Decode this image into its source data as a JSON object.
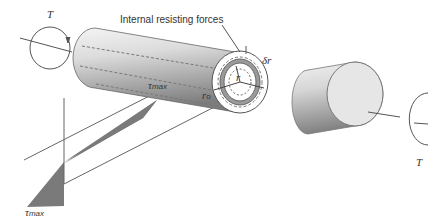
{
  "diagram": {
    "title_label": "Internal resisting forces",
    "torque_left": "T",
    "torque_right": "T",
    "tau_top": {
      "symbol": "τ",
      "subscript": "max"
    },
    "tau_bottom": {
      "symbol": "τ",
      "subscript": "max"
    },
    "radius_outer": {
      "symbol": "r",
      "subscript": "o"
    },
    "radius": "r",
    "delta_r": "δr",
    "colors": {
      "cylinder_light": "#eeeeee",
      "cylinder_dark": "#8a8a8a",
      "stress_fill": "#7a7a7a",
      "line": "#555555",
      "ring": "#9a9a9a"
    }
  }
}
